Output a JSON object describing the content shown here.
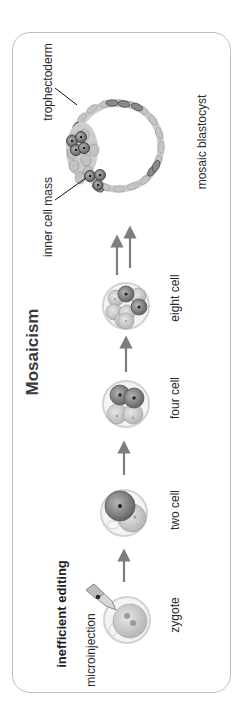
{
  "figure": {
    "title": "Mosaicism",
    "method_label": "inefficient editing",
    "delivery_label": "microinjection",
    "stages": [
      {
        "id": "zygote",
        "label": "zygote"
      },
      {
        "id": "two-cell",
        "label": "two cell"
      },
      {
        "id": "four-cell",
        "label": "four cell"
      },
      {
        "id": "eight-cell",
        "label": "eight cell"
      },
      {
        "id": "blastocyst",
        "label": "mosaic blastocyst"
      }
    ],
    "blastocyst_parts": {
      "trophectoderm": "trophectoderm",
      "inner_cell_mass": "inner cell mass"
    },
    "colors": {
      "frame": "#bdbdbd",
      "unedited_cell": "#c2c2c2",
      "edited_cell": "#7a7a7a",
      "arrow": "#7d7d7d",
      "zona": "#d6d6d6"
    }
  }
}
